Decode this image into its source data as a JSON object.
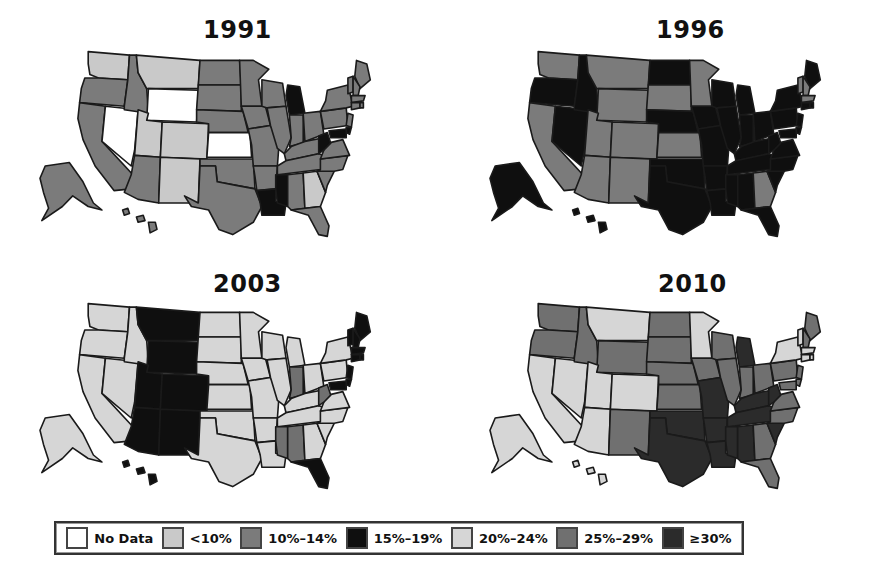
{
  "chart_data": {
    "type": "choropleth",
    "title": "",
    "panels": [
      "1991",
      "1996",
      "2003",
      "2010"
    ],
    "legend": [
      {
        "bin": 0,
        "label": "No Data",
        "color": "#ffffff"
      },
      {
        "bin": 1,
        "label": "<10%",
        "color": "#c9c9c9"
      },
      {
        "bin": 2,
        "label": "10%–14%",
        "color": "#7b7b7b"
      },
      {
        "bin": 3,
        "label": "15%–19%",
        "color": "#0f0f0f"
      },
      {
        "bin": 4,
        "label": "20%–24%",
        "color": "#d6d6d6"
      },
      {
        "bin": 5,
        "label": "25%–29%",
        "color": "#707070"
      },
      {
        "bin": 6,
        "label": "≥30%",
        "color": "#2b2b2b"
      }
    ],
    "legend_position": "bottom",
    "values": {
      "1991": {
        "WA": 1,
        "OR": 2,
        "CA": 2,
        "NV": 0,
        "ID": 2,
        "MT": 1,
        "WY": 0,
        "UT": 1,
        "CO": 1,
        "AZ": 2,
        "NM": 1,
        "ND": 2,
        "SD": 2,
        "NE": 2,
        "KS": 0,
        "OK": 2,
        "TX": 2,
        "MN": 2,
        "IA": 2,
        "MO": 2,
        "AR": 2,
        "LA": 3,
        "WI": 2,
        "IL": 2,
        "MI": 3,
        "IN": 2,
        "OH": 2,
        "KY": 2,
        "TN": 2,
        "MS": 3,
        "AL": 2,
        "GA": 1,
        "FL": 2,
        "SC": 2,
        "NC": 2,
        "VA": 2,
        "WV": 3,
        "PA": 2,
        "NY": 2,
        "ME": 2,
        "VT": 2,
        "NH": 2,
        "MA": 2,
        "CT": 2,
        "RI": 2,
        "NJ": 2,
        "DE": 3,
        "MD": 3,
        "AK": 2,
        "HI": 2
      },
      "1996": {
        "WA": 2,
        "OR": 3,
        "CA": 2,
        "NV": 3,
        "ID": 3,
        "MT": 2,
        "WY": 2,
        "UT": 2,
        "CO": 2,
        "AZ": 2,
        "NM": 2,
        "ND": 3,
        "SD": 2,
        "NE": 3,
        "KS": 2,
        "OK": 3,
        "TX": 3,
        "MN": 2,
        "IA": 3,
        "MO": 3,
        "AR": 3,
        "LA": 3,
        "WI": 3,
        "IL": 3,
        "MI": 3,
        "IN": 3,
        "OH": 3,
        "KY": 3,
        "TN": 3,
        "MS": 3,
        "AL": 3,
        "GA": 2,
        "FL": 3,
        "SC": 3,
        "NC": 3,
        "VA": 3,
        "WV": 3,
        "PA": 3,
        "NY": 3,
        "ME": 3,
        "VT": 2,
        "NH": 2,
        "MA": 2,
        "CT": 3,
        "RI": 3,
        "NJ": 3,
        "DE": 3,
        "MD": 3,
        "AK": 3,
        "HI": 3
      },
      "2003": {
        "WA": 4,
        "OR": 4,
        "CA": 4,
        "NV": 4,
        "ID": 4,
        "MT": 3,
        "WY": 3,
        "UT": 3,
        "CO": 3,
        "AZ": 3,
        "NM": 3,
        "ND": 4,
        "SD": 4,
        "NE": 4,
        "KS": 4,
        "OK": 4,
        "TX": 4,
        "MN": 4,
        "IA": 4,
        "MO": 4,
        "AR": 4,
        "LA": 4,
        "WI": 4,
        "IL": 4,
        "MI": 4,
        "IN": 5,
        "OH": 4,
        "KY": 4,
        "TN": 4,
        "MS": 5,
        "AL": 5,
        "GA": 4,
        "FL": 3,
        "SC": 4,
        "NC": 4,
        "VA": 4,
        "WV": 5,
        "PA": 4,
        "NY": 4,
        "ME": 3,
        "VT": 3,
        "NH": 3,
        "MA": 3,
        "CT": 3,
        "RI": 3,
        "NJ": 3,
        "DE": 3,
        "MD": 3,
        "AK": 4,
        "HI": 3
      },
      "2010": {
        "WA": 5,
        "OR": 5,
        "CA": 4,
        "NV": 4,
        "ID": 5,
        "MT": 4,
        "WY": 5,
        "UT": 4,
        "CO": 4,
        "AZ": 4,
        "NM": 5,
        "ND": 5,
        "SD": 5,
        "NE": 5,
        "KS": 5,
        "OK": 6,
        "TX": 6,
        "MN": 4,
        "IA": 5,
        "MO": 6,
        "AR": 6,
        "LA": 6,
        "WI": 5,
        "IL": 5,
        "MI": 6,
        "IN": 5,
        "OH": 5,
        "KY": 6,
        "TN": 6,
        "MS": 6,
        "AL": 6,
        "GA": 5,
        "FL": 5,
        "SC": 6,
        "NC": 5,
        "VA": 5,
        "WV": 6,
        "PA": 5,
        "NY": 4,
        "ME": 5,
        "VT": 4,
        "NH": 5,
        "MA": 4,
        "CT": 4,
        "RI": 4,
        "NJ": 5,
        "DE": 5,
        "MD": 5,
        "AK": 4,
        "HI": 4
      }
    }
  },
  "panels": [
    {
      "year": "1991"
    },
    {
      "year": "1996"
    },
    {
      "year": "2003"
    },
    {
      "year": "2010"
    }
  ],
  "legend": {
    "items": [
      "No Data",
      "<10%",
      "10%–14%",
      "15%–19%",
      "20%–24%",
      "25%–29%",
      "≥30%"
    ]
  }
}
